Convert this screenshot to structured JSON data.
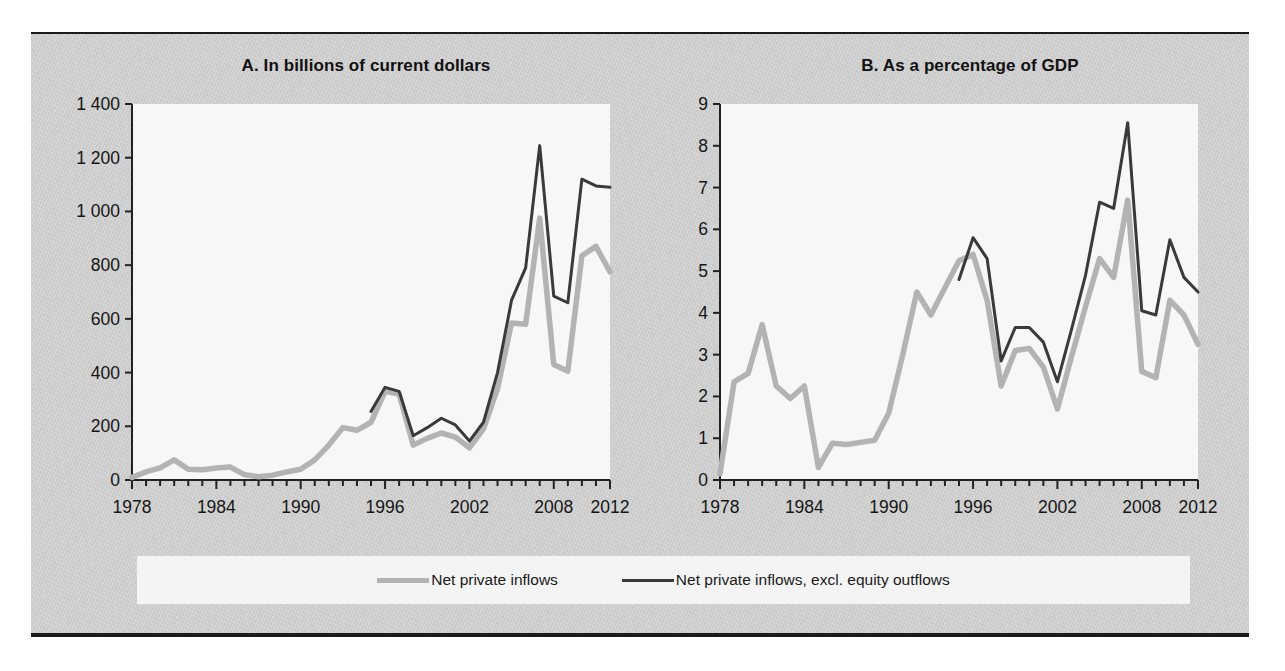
{
  "figure": {
    "background_color": "#cdcdcd",
    "rule_color": "#1b1b1b",
    "plot_background": "#f7f7f7"
  },
  "series_colors": {
    "net_private_inflows": "#b3b3b3",
    "net_private_inflows_excl": "#3a3a3a"
  },
  "legend": {
    "items": [
      {
        "label": "Net private inflows",
        "color": "#b3b3b3",
        "swatch": "line-swatch-gray"
      },
      {
        "label": "Net private inflows, excl. equity outflows",
        "color": "#3a3a3a",
        "swatch": "line-swatch-dark"
      }
    ]
  },
  "chart_data": [
    {
      "panel": "A",
      "type": "line",
      "title": "A. In billions of current dollars",
      "xlabel": "",
      "ylabel": "",
      "xlim": [
        1978,
        2012
      ],
      "ylim": [
        0,
        1400
      ],
      "ytick_labels": [
        "0",
        "200",
        "400",
        "600",
        "800",
        "1 000",
        "1 200",
        "1 400"
      ],
      "ytick_values": [
        0,
        200,
        400,
        600,
        800,
        1000,
        1200,
        1400
      ],
      "xtick_labels": [
        "1978",
        "1984",
        "1990",
        "1996",
        "2002",
        "2008",
        "2012"
      ],
      "xtick_values": [
        1978,
        1984,
        1990,
        1996,
        2002,
        2008,
        2012
      ],
      "minor_xticks_every": 1,
      "grid": false,
      "legend_position": "below-figure",
      "x": [
        1978,
        1979,
        1980,
        1981,
        1982,
        1983,
        1984,
        1985,
        1986,
        1987,
        1988,
        1989,
        1990,
        1991,
        1992,
        1993,
        1994,
        1995,
        1996,
        1997,
        1998,
        1999,
        2000,
        2001,
        2002,
        2003,
        2004,
        2005,
        2006,
        2007,
        2008,
        2009,
        2010,
        2011,
        2012
      ],
      "series": [
        {
          "name": "Net private inflows",
          "color": "#b3b3b3",
          "values": [
            10,
            30,
            45,
            75,
            40,
            38,
            45,
            48,
            20,
            12,
            18,
            30,
            40,
            75,
            130,
            195,
            185,
            215,
            330,
            320,
            130,
            155,
            175,
            160,
            120,
            190,
            340,
            585,
            580,
            975,
            430,
            405,
            835,
            870,
            775
          ]
        },
        {
          "name": "Net private inflows, excl. equity outflows",
          "color": "#3a3a3a",
          "values": [
            null,
            null,
            null,
            null,
            null,
            null,
            null,
            null,
            null,
            null,
            null,
            null,
            null,
            null,
            null,
            null,
            null,
            255,
            345,
            330,
            165,
            195,
            230,
            205,
            145,
            215,
            400,
            670,
            790,
            1245,
            685,
            660,
            1120,
            1095,
            1090
          ]
        }
      ]
    },
    {
      "panel": "B",
      "type": "line",
      "title": "B. As a percentage of GDP",
      "xlabel": "",
      "ylabel": "",
      "xlim": [
        1978,
        2012
      ],
      "ylim": [
        0,
        9
      ],
      "ytick_labels": [
        "0",
        "1",
        "2",
        "3",
        "4",
        "5",
        "6",
        "7",
        "8",
        "9"
      ],
      "ytick_values": [
        0,
        1,
        2,
        3,
        4,
        5,
        6,
        7,
        8,
        9
      ],
      "xtick_labels": [
        "1978",
        "1984",
        "1990",
        "1996",
        "2002",
        "2008",
        "2012"
      ],
      "xtick_values": [
        1978,
        1984,
        1990,
        1996,
        2002,
        2008,
        2012
      ],
      "minor_xticks_every": 1,
      "grid": false,
      "legend_position": "below-figure",
      "x": [
        1978,
        1979,
        1980,
        1981,
        1982,
        1983,
        1984,
        1985,
        1986,
        1987,
        1988,
        1989,
        1990,
        1991,
        1992,
        1993,
        1994,
        1995,
        1996,
        1997,
        1998,
        1999,
        2000,
        2001,
        2002,
        2003,
        2004,
        2005,
        2006,
        2007,
        2008,
        2009,
        2010,
        2011,
        2012
      ],
      "series": [
        {
          "name": "Net private inflows",
          "color": "#b3b3b3",
          "values": [
            0.15,
            2.35,
            2.55,
            3.72,
            2.25,
            1.95,
            2.25,
            0.3,
            0.88,
            0.85,
            0.9,
            0.95,
            1.6,
            3.0,
            4.5,
            3.95,
            4.6,
            5.25,
            5.4,
            4.3,
            2.25,
            3.1,
            3.15,
            2.7,
            1.7,
            2.95,
            4.15,
            5.3,
            4.85,
            6.7,
            2.6,
            2.45,
            4.3,
            3.95,
            3.25
          ]
        },
        {
          "name": "Net private inflows, excl. equity outflows",
          "color": "#3a3a3a",
          "values": [
            null,
            null,
            null,
            null,
            null,
            null,
            null,
            null,
            null,
            null,
            null,
            null,
            null,
            null,
            null,
            null,
            null,
            4.8,
            5.8,
            5.3,
            2.85,
            3.65,
            3.65,
            3.3,
            2.35,
            3.6,
            4.9,
            6.65,
            6.5,
            8.55,
            4.05,
            3.95,
            5.75,
            4.85,
            4.5
          ]
        }
      ]
    }
  ]
}
